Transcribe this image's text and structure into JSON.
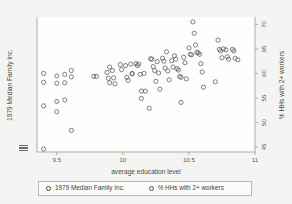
{
  "chart_data": {
    "type": "scatter",
    "title": "",
    "xlabel": "average education level",
    "ylabel_left": "1979 Median Family Inc.",
    "ylabel_right": "% HHs with 2+ workers",
    "xlim": [
      9.35,
      11.0
    ],
    "ylim_right": [
      44.0,
      71.5
    ],
    "xticks": [
      "9.5",
      "10",
      "10.5",
      "11"
    ],
    "xtick_values": [
      9.5,
      10,
      10.5,
      11
    ],
    "yticks_right": [
      "45",
      "50",
      "55",
      "60",
      "65",
      "70"
    ],
    "ytick_values_right": [
      45,
      50,
      55,
      60,
      65,
      70
    ],
    "grid": false,
    "legend_position": "below",
    "marker_style": "open-circle",
    "marker_color": "#58585a",
    "series": [
      {
        "name": "1979 Median Family Inc.",
        "marker": "open-circle",
        "points": [
          [
            9.4,
            60.0
          ],
          [
            9.4,
            58.2
          ],
          [
            9.4,
            53.4
          ],
          [
            9.4,
            44.6
          ],
          [
            9.5,
            59.5
          ],
          [
            9.5,
            58.0
          ],
          [
            9.5,
            54.3
          ],
          [
            9.5,
            52.2
          ],
          [
            9.56,
            59.8
          ],
          [
            9.56,
            58.1
          ],
          [
            9.56,
            54.6
          ],
          [
            9.61,
            60.6
          ],
          [
            9.61,
            59.3
          ],
          [
            9.61,
            48.4
          ],
          [
            9.78,
            59.4
          ],
          [
            9.8,
            59.4
          ],
          [
            9.88,
            60.2
          ],
          [
            9.89,
            59.0
          ],
          [
            9.9,
            61.3
          ],
          [
            9.9,
            58.1
          ],
          [
            9.92,
            60.6
          ],
          [
            9.93,
            59.1
          ],
          [
            9.94,
            57.9
          ],
          [
            9.98,
            61.8
          ],
          [
            9.99,
            60.8
          ],
          [
            10.02,
            61.6
          ],
          [
            10.03,
            59.2
          ],
          [
            10.04,
            58.6
          ],
          [
            10.06,
            61.9
          ],
          [
            10.07,
            60.0
          ],
          [
            10.07,
            59.9
          ],
          [
            10.1,
            62.0
          ],
          [
            10.11,
            61.6
          ],
          [
            10.12,
            61.9
          ],
          [
            10.13,
            59.8
          ],
          [
            10.14,
            54.9
          ],
          [
            10.14,
            56.4
          ],
          [
            10.16,
            60.0
          ],
          [
            10.17,
            56.4
          ],
          [
            10.2,
            52.9
          ],
          [
            10.21,
            63.0
          ],
          [
            10.22,
            62.9
          ],
          [
            10.23,
            61.4
          ],
          [
            10.24,
            60.6
          ],
          [
            10.25,
            58.4
          ],
          [
            10.26,
            62.4
          ],
          [
            10.27,
            60.1
          ],
          [
            10.28,
            56.8
          ],
          [
            10.3,
            63.1
          ],
          [
            10.31,
            62.5
          ],
          [
            10.32,
            61.1
          ],
          [
            10.33,
            64.4
          ],
          [
            10.34,
            60.5
          ],
          [
            10.35,
            58.7
          ],
          [
            10.37,
            62.6
          ],
          [
            10.38,
            61.3
          ],
          [
            10.39,
            63.6
          ],
          [
            10.4,
            62.9
          ],
          [
            10.41,
            61.0
          ],
          [
            10.42,
            60.7
          ],
          [
            10.43,
            59.4
          ],
          [
            10.44,
            59.2
          ],
          [
            10.44,
            54.1
          ],
          [
            10.46,
            63.3
          ],
          [
            10.47,
            62.2
          ],
          [
            10.48,
            58.9
          ],
          [
            10.5,
            65.2
          ],
          [
            10.51,
            63.9
          ],
          [
            10.52,
            63.8
          ],
          [
            10.53,
            70.5
          ],
          [
            10.54,
            68.2
          ],
          [
            10.55,
            65.8
          ],
          [
            10.56,
            64.3
          ],
          [
            10.57,
            64.2
          ],
          [
            10.58,
            63.9
          ],
          [
            10.59,
            62.0
          ],
          [
            10.6,
            60.3
          ],
          [
            10.61,
            57.2
          ],
          [
            10.7,
            58.3
          ],
          [
            10.72,
            66.8
          ],
          [
            10.73,
            64.9
          ],
          [
            10.74,
            64.6
          ],
          [
            10.75,
            63.2
          ],
          [
            10.76,
            65.0
          ],
          [
            10.78,
            64.8
          ],
          [
            10.79,
            63.4
          ],
          [
            10.8,
            62.9
          ],
          [
            10.83,
            64.9
          ],
          [
            10.84,
            64.6
          ],
          [
            10.85,
            63.1
          ],
          [
            10.87,
            62.8
          ]
        ]
      }
    ],
    "legend": [
      {
        "label": "1979 Median Family Inc.",
        "marker": "open-circle"
      },
      {
        "label": "% HHs with 2+ workers",
        "marker": "open-circle"
      }
    ]
  },
  "axes": {
    "x_title": "average education level",
    "y_left_title": "1979 Median Family Inc.",
    "y_right_title": "% HHs with 2+ workers"
  }
}
